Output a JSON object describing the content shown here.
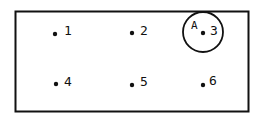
{
  "diagram": {
    "frame": {
      "x": 15,
      "y": 11,
      "width": 233,
      "height": 100
    },
    "points": [
      {
        "id": "1",
        "label": "1",
        "x": 55,
        "y": 34
      },
      {
        "id": "2",
        "label": "2",
        "x": 132,
        "y": 33
      },
      {
        "id": "3",
        "label": "3",
        "x": 203,
        "y": 33
      },
      {
        "id": "4",
        "label": "4",
        "x": 56,
        "y": 84
      },
      {
        "id": "5",
        "label": "5",
        "x": 132,
        "y": 85
      },
      {
        "id": "6",
        "label": "6",
        "x": 203,
        "y": 85
      }
    ],
    "circle": {
      "label": "A",
      "cx": 203,
      "cy": 32,
      "r": 20
    }
  }
}
